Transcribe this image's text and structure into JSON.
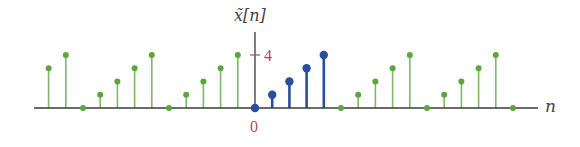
{
  "chart_data": {
    "type": "stem",
    "title": "",
    "ylabel": "x̃[n]",
    "xlabel": "n",
    "x": [
      -12,
      -11,
      -10,
      -9,
      -8,
      -7,
      -6,
      -5,
      -4,
      -3,
      -2,
      -1,
      0,
      1,
      2,
      3,
      4,
      5,
      6,
      7,
      8,
      9,
      10,
      11,
      12,
      13,
      14,
      15
    ],
    "values": [
      3,
      4,
      0,
      1,
      2,
      3,
      4,
      0,
      1,
      2,
      3,
      4,
      0,
      1,
      2,
      3,
      4,
      0,
      1,
      2,
      3,
      4,
      0,
      1,
      2,
      3,
      4,
      0
    ],
    "period": 5,
    "highlighted_period": {
      "n_start": 0,
      "n_end": 4,
      "values": [
        0,
        1,
        2,
        3,
        4
      ]
    },
    "series": [
      {
        "name": "one period (n=0..4)",
        "color": "#2a4d9c"
      },
      {
        "name": "periodic extension",
        "color": "#5aa83c"
      }
    ],
    "yticks": [
      {
        "value": 4,
        "label": "4"
      }
    ],
    "xticks": [
      {
        "value": 0,
        "label": "0"
      }
    ],
    "grid": false,
    "legend": "none",
    "ylim": [
      0,
      5
    ]
  },
  "labels": {
    "y_axis": "x̃[n]",
    "x_axis": "n",
    "ytick_4": "4",
    "xtick_0": "0"
  },
  "colors": {
    "axis": "#3a3a3a",
    "tick_label": "#b04a5a",
    "highlight": "#2a4d9c",
    "periodic": "#5aa83c",
    "periodic_stem": "#7fb866"
  }
}
